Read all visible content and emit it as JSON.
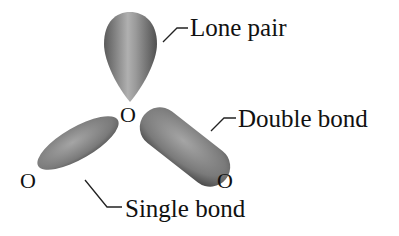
{
  "diagram": {
    "atoms": {
      "center": "O",
      "left": "O",
      "right": "O"
    },
    "labels": {
      "lone_pair": "Lone pair",
      "double_bond": "Double bond",
      "single_bond": "Single bond"
    },
    "colors": {
      "lobe_dark": "#555555",
      "lobe_light": "#a8a8a8",
      "text": "#111111",
      "background": "#ffffff"
    }
  }
}
